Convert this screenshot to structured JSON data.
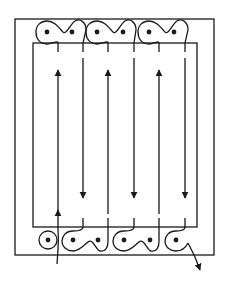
{
  "diagram": {
    "type": "winding-coil-cross-section",
    "stroke_color": "#1a1a1a",
    "background": "#ffffff",
    "outer_frame": {
      "x": 15,
      "y": 19,
      "w": 199,
      "h": 236
    },
    "inner_frame": {
      "x": 33,
      "y": 43,
      "w": 164,
      "h": 184
    },
    "vertical_conductors": [
      {
        "x": 58,
        "direction": "up"
      },
      {
        "x": 83,
        "direction": "down"
      },
      {
        "x": 108,
        "direction": "up"
      },
      {
        "x": 134,
        "direction": "down"
      },
      {
        "x": 159,
        "direction": "up"
      },
      {
        "x": 185,
        "direction": "down"
      }
    ],
    "top_dots": [
      {
        "x": 47,
        "y": 32
      },
      {
        "x": 72,
        "y": 32
      },
      {
        "x": 97,
        "y": 32
      },
      {
        "x": 123,
        "y": 32
      },
      {
        "x": 149,
        "y": 32
      },
      {
        "x": 174,
        "y": 32
      }
    ],
    "bottom_dots": [
      {
        "x": 48,
        "y": 240
      },
      {
        "x": 73,
        "y": 240
      },
      {
        "x": 98,
        "y": 240
      },
      {
        "x": 124,
        "y": 240
      },
      {
        "x": 150,
        "y": 240
      },
      {
        "x": 176,
        "y": 240
      }
    ],
    "lead_in": {
      "direction": "up",
      "x": 58
    },
    "lead_out": {
      "direction": "down-right",
      "tip_x": 200,
      "tip_y": 270
    }
  }
}
